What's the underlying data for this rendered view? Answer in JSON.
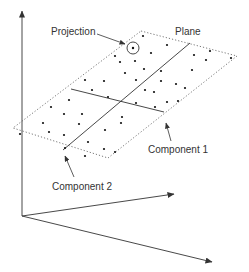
{
  "diagram": {
    "labels": {
      "projection": "Projection",
      "plane": "Plane",
      "component1": "Component 1",
      "component2": "Component 2"
    },
    "colors": {
      "stroke": "#333333",
      "background": "#ffffff"
    },
    "axes": [
      {
        "name": "vertical-axis",
        "from": [
          22,
          216
        ],
        "to": [
          22,
          10
        ]
      },
      {
        "name": "axis-2",
        "from": [
          22,
          216
        ],
        "to": [
          174,
          194
        ]
      },
      {
        "name": "axis-3",
        "from": [
          22,
          216
        ],
        "to": [
          212,
          262
        ]
      }
    ],
    "plane_corners": [
      [
        141,
        31
      ],
      [
        237,
        56
      ],
      [
        108,
        158
      ],
      [
        13,
        128
      ]
    ],
    "component1_line": {
      "from": [
        190,
        43
      ],
      "to": [
        63,
        150
      ]
    },
    "component2_line": {
      "from": [
        71,
        89
      ],
      "to": [
        164,
        112
      ]
    },
    "projection_point": {
      "cx": 133,
      "cy": 48,
      "r": 6
    }
  }
}
